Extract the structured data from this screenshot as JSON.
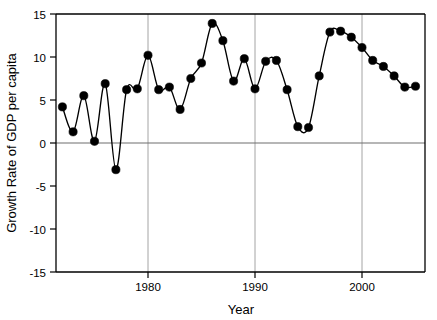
{
  "chart_data": {
    "type": "line",
    "title": "",
    "subtitle": "",
    "xlabel": "Year",
    "ylabel": "Growth Rate of GDP per capita",
    "xlim": [
      1971,
      2007
    ],
    "ylim": [
      -15,
      15
    ],
    "xticks": [
      1980,
      1990,
      2000
    ],
    "xtick_labels": [
      "1980",
      "1990",
      "2000"
    ],
    "yticks": [
      -15,
      -10,
      -5,
      0,
      5,
      10,
      15
    ],
    "ytick_labels": [
      "-15",
      "-10",
      "-5",
      "0",
      "5",
      "10",
      "15"
    ],
    "grid": "vertical-only",
    "legend": "none",
    "marker": "filled-circle",
    "x": [
      1972,
      1973,
      1974,
      1975,
      1976,
      1977,
      1978,
      1979,
      1980,
      1981,
      1982,
      1983,
      1984,
      1985,
      1986,
      1987,
      1988,
      1989,
      1990,
      1991,
      1992,
      1993,
      1994,
      1995,
      1996,
      1997,
      1998,
      1999,
      2000,
      2001,
      2002,
      2003,
      2004,
      2005,
      2006
    ],
    "values": [
      4.2,
      1.3,
      5.5,
      0.2,
      6.9,
      -3.1,
      6.2,
      6.3,
      10.2,
      6.2,
      6.5,
      3.9,
      7.5,
      9.3,
      13.9,
      11.9,
      7.2,
      9.8,
      6.3,
      9.5,
      9.6,
      6.2,
      1.9,
      1.8,
      7.8,
      12.9,
      13.0,
      12.3,
      11.1,
      9.6,
      8.9,
      7.8,
      6.5,
      6.6,
      7.9
    ],
    "series": [
      {
        "name": "Growth Rate of GDP per capita",
        "values": [
          4.2,
          1.3,
          5.5,
          0.2,
          6.9,
          -3.1,
          6.2,
          6.3,
          10.2,
          6.2,
          6.5,
          3.9,
          7.5,
          9.3,
          13.9,
          11.9,
          7.2,
          9.8,
          6.3,
          9.5,
          9.6,
          6.2,
          1.9,
          1.8,
          7.8,
          12.9,
          13.0,
          12.3,
          11.1,
          9.6,
          8.9,
          7.8,
          6.5,
          6.6,
          7.9
        ]
      }
    ],
    "points_after_2000": [
      {
        "x": 2001,
        "y": 9.6
      },
      {
        "x": 2002,
        "y": 8.9
      },
      {
        "x": 2003,
        "y": 7.8
      },
      {
        "x": 2004,
        "y": 6.5
      },
      {
        "x": 2005,
        "y": 6.6
      },
      {
        "x": 2006,
        "y": 7.9
      },
      {
        "x": 2006.6,
        "y": 8.6
      },
      {
        "x": 2007,
        "y": 9.3
      },
      {
        "x": 2007.4,
        "y": 10.0
      },
      {
        "x": 2007.8,
        "y": 10.3
      },
      {
        "x": 2008.2,
        "y": 11.1
      }
    ]
  },
  "axis": {
    "y_title": "Growth Rate of GDP per capita",
    "x_title": "Year",
    "y_labels": [
      "15",
      "10",
      "5",
      "0",
      "-5",
      "-10",
      "-15"
    ],
    "x_labels": [
      "1980",
      "1990",
      "2000"
    ]
  },
  "colors": {
    "line": "#000000",
    "marker": "#000000",
    "grid": "#9a9a9a",
    "axis": "#000000",
    "zero": "#6e6e6e",
    "background": "#ffffff"
  }
}
